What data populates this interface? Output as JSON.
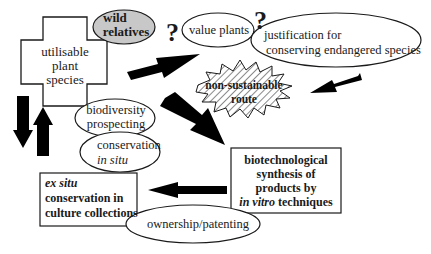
{
  "nodes": {
    "utilisable": {
      "line1": "utilisable",
      "line2": "plant",
      "line3": "species"
    },
    "wild_relatives": {
      "line1": "wild",
      "line2": "relatives",
      "fill": "#c8c8c8"
    },
    "value_plants": {
      "label": "value plants"
    },
    "justification": {
      "line1": "justification  for",
      "line2": "conserving endangered species"
    },
    "non_sustainable": {
      "line1": "non-sustainable",
      "line2": "route"
    },
    "biodiversity": {
      "line1": "biodiversity",
      "line2": "prospecting"
    },
    "in_situ": {
      "line1": "conservation",
      "line2": "in situ"
    },
    "biotech": {
      "line1": "biotechnological",
      "line2": "synthesis of",
      "line3": "products by",
      "line4_italic": "in vitro",
      "line4_rest": " techniques"
    },
    "ex_situ": {
      "line1": "ex situ",
      "line2": "conservation in",
      "line3": "culture collections"
    },
    "ownership": {
      "label": "ownership/patenting"
    }
  },
  "marks": {
    "question1": "?",
    "question2": "?"
  },
  "colors": {
    "stroke": "#1a1a1a",
    "arrow": "#000000",
    "hatch": "#9a9a9a"
  }
}
